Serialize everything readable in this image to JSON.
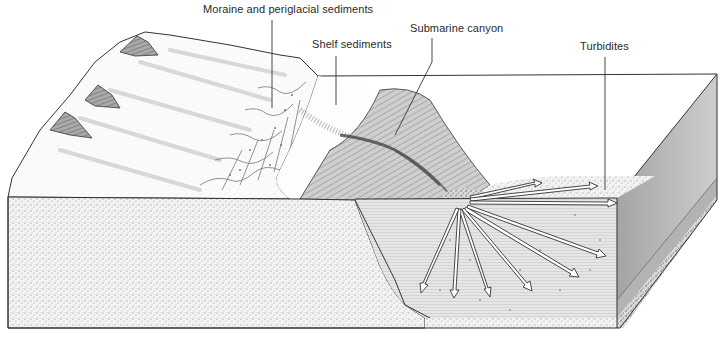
{
  "diagram": {
    "labels": [
      {
        "id": "moraine",
        "text": "Moraine and periglacial sediments"
      },
      {
        "id": "shelf",
        "text": "Shelf sediments"
      },
      {
        "id": "canyon",
        "text": "Submarine canyon"
      },
      {
        "id": "turbidites",
        "text": "Turbidites"
      }
    ],
    "features": {
      "mountain_peaks": 3,
      "turbidite_arrows": 10
    },
    "colors": {
      "line": "#2a2a2a",
      "stipple": "#8a8a8a",
      "shade_dark": "#6e6e6e",
      "shade_mid": "#a8a8a8",
      "background": "#ffffff"
    }
  }
}
